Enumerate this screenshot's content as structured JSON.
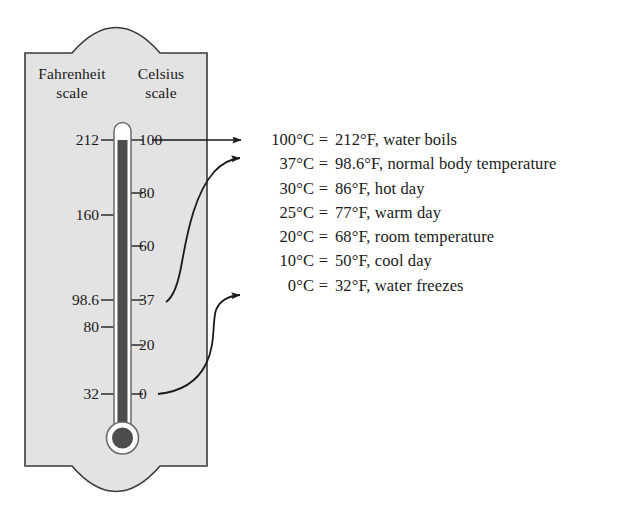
{
  "figure": {
    "panel_fill": "#e3e3e3",
    "panel_stroke": "#3a3a3a",
    "mercury_color": "#4d4d4d",
    "tube_fill": "#ffffff",
    "tube_stroke": "#6b6b6b",
    "text_color": "#1a1a1a"
  },
  "headers": {
    "fahrenheit_line1": "Fahrenheit",
    "fahrenheit_line2": "scale",
    "celsius_line1": "Celsius",
    "celsius_line2": "scale"
  },
  "fahrenheit_ticks": [
    {
      "label": "212",
      "y": 140
    },
    {
      "label": "160",
      "y": 215
    },
    {
      "label": "98.6",
      "y": 300
    },
    {
      "label": "80",
      "y": 327
    },
    {
      "label": "32",
      "y": 394
    }
  ],
  "celsius_ticks": [
    {
      "label": "100",
      "y": 140
    },
    {
      "label": "80",
      "y": 193
    },
    {
      "label": "60",
      "y": 246
    },
    {
      "label": "37",
      "y": 300
    },
    {
      "label": "20",
      "y": 345
    },
    {
      "label": "0",
      "y": 394
    }
  ],
  "conversions": [
    {
      "celsius": "100°C",
      "equals": "=",
      "fahrenheit": "212°F, water boils"
    },
    {
      "celsius": "37°C",
      "equals": "=",
      "fahrenheit": "98.6°F, normal body temperature"
    },
    {
      "celsius": "30°C",
      "equals": "=",
      "fahrenheit": "86°F, hot day"
    },
    {
      "celsius": "25°C",
      "equals": "=",
      "fahrenheit": "77°F, warm day"
    },
    {
      "celsius": "20°C",
      "equals": "=",
      "fahrenheit": "68°F, room temperature"
    },
    {
      "celsius": "10°C",
      "equals": "=",
      "fahrenheit": "50°F, cool day"
    },
    {
      "celsius": "0°C",
      "equals": "=",
      "fahrenheit": "32°F, water freezes"
    }
  ],
  "leaders": [
    {
      "name": "leader-boiling",
      "from_tick": "100",
      "to_row": 0,
      "shape": "straight"
    },
    {
      "name": "leader-body",
      "from_tick": "37",
      "to_row": 1,
      "shape": "curved"
    },
    {
      "name": "leader-freezing",
      "from_tick": "0",
      "to_row": 6,
      "shape": "curved"
    }
  ]
}
